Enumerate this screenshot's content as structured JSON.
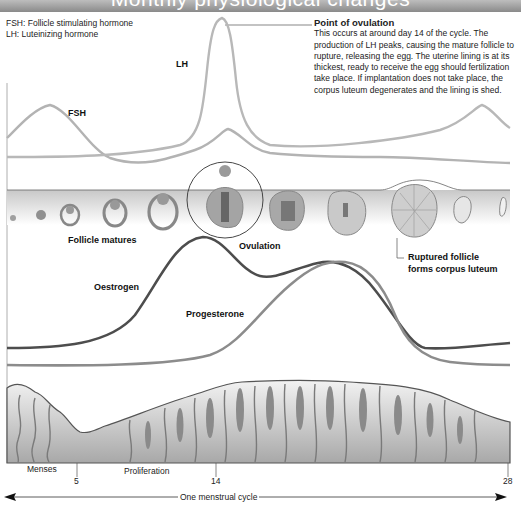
{
  "title": "Monthly physiological changes",
  "legend": [
    "FSH: Follicle stimulating hormone",
    "LH: Luteinizing hormone"
  ],
  "callout": {
    "heading": "Point of ovulation",
    "body": "This occurs at around day 14 of the cycle. The production of LH peaks, causing the mature follicle to rupture, releasing the egg. The uterine lining is at its thickest, ready to receive the egg should fertilization take place. If implantation does not take place, the corpus luteum degenerates and the lining is shed."
  },
  "hormones": {
    "lh": "LH",
    "fsh": "FSH",
    "oestrogen": "Oestrogen",
    "progesterone": "Progesterone"
  },
  "ovary_labels": {
    "follicle_matures": "Follicle matures",
    "ovulation": "Ovulation",
    "ruptured_line1": "Ruptured follicle",
    "ruptured_line2": "forms corpus luteum"
  },
  "phases": {
    "menses": "Menses",
    "proliferation": "Proliferation"
  },
  "days": [
    "5",
    "14",
    "28"
  ],
  "cycle_label": "One menstrual cycle",
  "colors": {
    "title_bar": "#9e9e9e",
    "lh_fsh_curve": "#b5b5b5",
    "oestrogen_curve": "#4d4d4d",
    "progesterone_curve": "#8c8c8c",
    "tissue": "#bdbdbd"
  }
}
